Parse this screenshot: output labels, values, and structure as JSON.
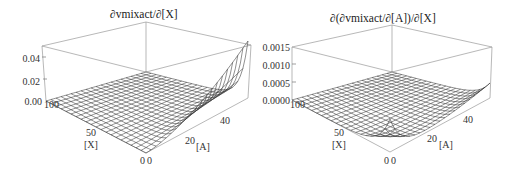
{
  "chart_data": [
    {
      "type": "surface3d",
      "title": "∂vmixact/∂[X]",
      "axes": {
        "x": {
          "label": "[X]",
          "ticks": [
            "100",
            "50",
            "0"
          ],
          "range": [
            0,
            100
          ]
        },
        "y": {
          "label": "[A]",
          "ticks": [
            "0",
            "20",
            "40"
          ],
          "range": [
            0,
            50
          ]
        },
        "z": {
          "label": "",
          "ticks": [
            "0.00",
            "0.02",
            "0.04"
          ],
          "range": [
            0,
            0.05
          ]
        }
      },
      "description": "Surface near 0 everywhere except rising sharply along the [X]≈0 edge as [A] increases, reaching ~0.035 at [A]=50",
      "samples": [
        {
          "X": 100,
          "A": 0,
          "z": 0.0
        },
        {
          "X": 100,
          "A": 50,
          "z": 0.0
        },
        {
          "X": 0,
          "A": 0,
          "z": 0.0
        },
        {
          "X": 0,
          "A": 25,
          "z": 0.01
        },
        {
          "X": 0,
          "A": 50,
          "z": 0.035
        }
      ],
      "grid": false,
      "mesh": true,
      "boxed": true
    },
    {
      "type": "surface3d",
      "title": "∂(∂vmixact/∂[A])/∂[X]",
      "axes": {
        "x": {
          "label": "[X]",
          "ticks": [
            "100",
            "50",
            "0"
          ],
          "range": [
            0,
            100
          ]
        },
        "y": {
          "label": "[A]",
          "ticks": [
            "0",
            "20",
            "40"
          ],
          "range": [
            0,
            50
          ]
        },
        "z": {
          "label": "",
          "ticks": [
            "0.0000",
            "0.0005",
            "0.0010",
            "0.0015"
          ],
          "range": [
            0,
            0.0015
          ]
        }
      },
      "description": "Surface near 0 at large [X]; near [X]≈0 it peaks at [A]≈0 (~0.0005), dips down then rises gently toward [A]=50 (~0.0002)",
      "samples": [
        {
          "X": 100,
          "A": 0,
          "z": 0.0
        },
        {
          "X": 100,
          "A": 50,
          "z": 0.0
        },
        {
          "X": 0,
          "A": 0,
          "z": 0.0005
        },
        {
          "X": 0,
          "A": 20,
          "z": 0.0001
        },
        {
          "X": 0,
          "A": 50,
          "z": 0.0002
        }
      ],
      "grid": false,
      "mesh": true,
      "boxed": true
    }
  ],
  "plots": [
    {
      "title": "∂vmixact/∂[X]",
      "z_ticks": [
        "0.04",
        "0.02",
        "0.00"
      ],
      "x_ticks": [
        "100",
        "50",
        "0"
      ],
      "x_label": "[X]",
      "y_ticks": [
        "0",
        "20",
        "40"
      ],
      "y_label": "[A]"
    },
    {
      "title": "∂(∂vmixact/∂[A])/∂[X]",
      "z_ticks": [
        "0.0015",
        "0.0010",
        "0.0005",
        "0.0000"
      ],
      "x_ticks": [
        "100",
        "50",
        "0"
      ],
      "x_label": "[X]",
      "y_ticks": [
        "0",
        "20",
        "40"
      ],
      "y_label": "[A]"
    }
  ]
}
